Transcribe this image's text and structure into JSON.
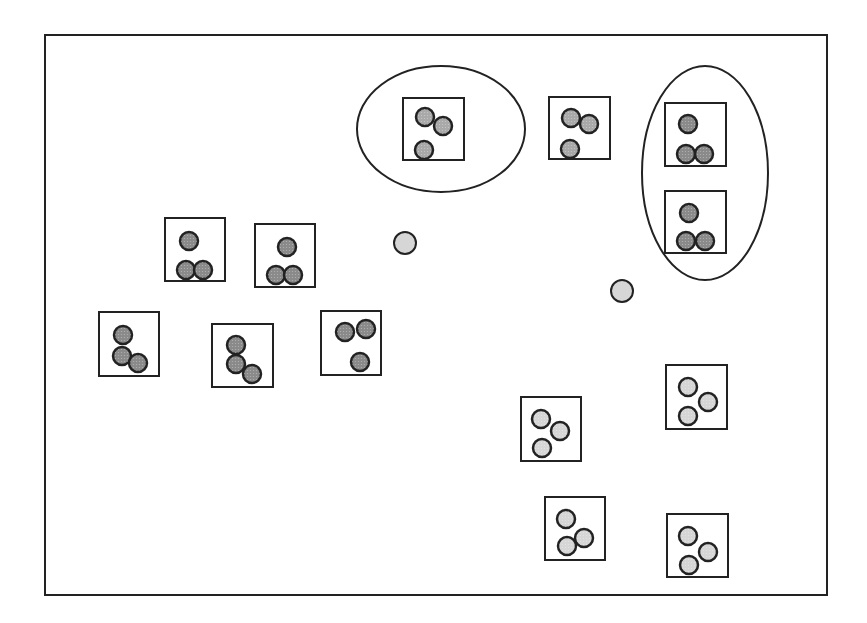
{
  "diagram": {
    "frame": {
      "x": 45,
      "y": 35,
      "w": 782,
      "h": 560
    },
    "colors": {
      "stroke": "#222222",
      "dark_fill": "#8a8a8a",
      "medium_fill": "#a9a9a9",
      "light_fill": "#d6d6d6",
      "background": "#ffffff"
    },
    "ellipses": [
      {
        "id": "group-top-center",
        "cx": 441,
        "cy": 129,
        "rx": 84,
        "ry": 63
      },
      {
        "id": "group-top-right",
        "cx": 705,
        "cy": 173,
        "rx": 63,
        "ry": 107
      }
    ],
    "boxes": [
      {
        "id": "box-1",
        "x": 403,
        "y": 98,
        "w": 61,
        "h": 62,
        "fill": "medium",
        "circles": [
          [
            425,
            117
          ],
          [
            443,
            126
          ],
          [
            424,
            150
          ]
        ]
      },
      {
        "id": "box-2",
        "x": 549,
        "y": 97,
        "w": 61,
        "h": 62,
        "fill": "medium",
        "circles": [
          [
            571,
            118
          ],
          [
            589,
            124
          ],
          [
            570,
            149
          ]
        ]
      },
      {
        "id": "box-3",
        "x": 665,
        "y": 103,
        "w": 61,
        "h": 63,
        "fill": "dark",
        "circles": [
          [
            688,
            124
          ],
          [
            686,
            154
          ],
          [
            704,
            154
          ]
        ]
      },
      {
        "id": "box-4",
        "x": 665,
        "y": 191,
        "w": 61,
        "h": 62,
        "fill": "dark",
        "circles": [
          [
            689,
            213
          ],
          [
            686,
            241
          ],
          [
            705,
            241
          ]
        ]
      },
      {
        "id": "box-5",
        "x": 165,
        "y": 218,
        "w": 60,
        "h": 63,
        "fill": "dark",
        "circles": [
          [
            189,
            241
          ],
          [
            186,
            270
          ],
          [
            203,
            270
          ]
        ]
      },
      {
        "id": "box-6",
        "x": 255,
        "y": 224,
        "w": 60,
        "h": 63,
        "fill": "dark",
        "circles": [
          [
            287,
            247
          ],
          [
            276,
            275
          ],
          [
            293,
            275
          ]
        ]
      },
      {
        "id": "box-7",
        "x": 99,
        "y": 312,
        "w": 60,
        "h": 64,
        "fill": "dark",
        "circles": [
          [
            123,
            335
          ],
          [
            122,
            356
          ],
          [
            138,
            363
          ]
        ]
      },
      {
        "id": "box-8",
        "x": 212,
        "y": 324,
        "w": 61,
        "h": 63,
        "fill": "dark",
        "circles": [
          [
            236,
            345
          ],
          [
            236,
            364
          ],
          [
            252,
            374
          ]
        ]
      },
      {
        "id": "box-9",
        "x": 321,
        "y": 311,
        "w": 60,
        "h": 64,
        "fill": "dark",
        "circles": [
          [
            345,
            332
          ],
          [
            366,
            329
          ],
          [
            360,
            362
          ]
        ]
      },
      {
        "id": "box-10",
        "x": 521,
        "y": 397,
        "w": 60,
        "h": 64,
        "fill": "light",
        "circles": [
          [
            541,
            419
          ],
          [
            560,
            431
          ],
          [
            542,
            448
          ]
        ]
      },
      {
        "id": "box-11",
        "x": 666,
        "y": 365,
        "w": 61,
        "h": 64,
        "fill": "light",
        "circles": [
          [
            688,
            387
          ],
          [
            708,
            402
          ],
          [
            688,
            416
          ]
        ]
      },
      {
        "id": "box-12",
        "x": 545,
        "y": 497,
        "w": 60,
        "h": 63,
        "fill": "light",
        "circles": [
          [
            566,
            519
          ],
          [
            584,
            538
          ],
          [
            567,
            546
          ]
        ]
      },
      {
        "id": "box-13",
        "x": 667,
        "y": 514,
        "w": 61,
        "h": 63,
        "fill": "light",
        "circles": [
          [
            688,
            536
          ],
          [
            708,
            552
          ],
          [
            689,
            565
          ]
        ]
      }
    ],
    "loose_circles": [
      {
        "id": "loose-1",
        "cx": 405,
        "cy": 243
      },
      {
        "id": "loose-2",
        "cx": 622,
        "cy": 291
      }
    ],
    "circle_radius": 9
  }
}
